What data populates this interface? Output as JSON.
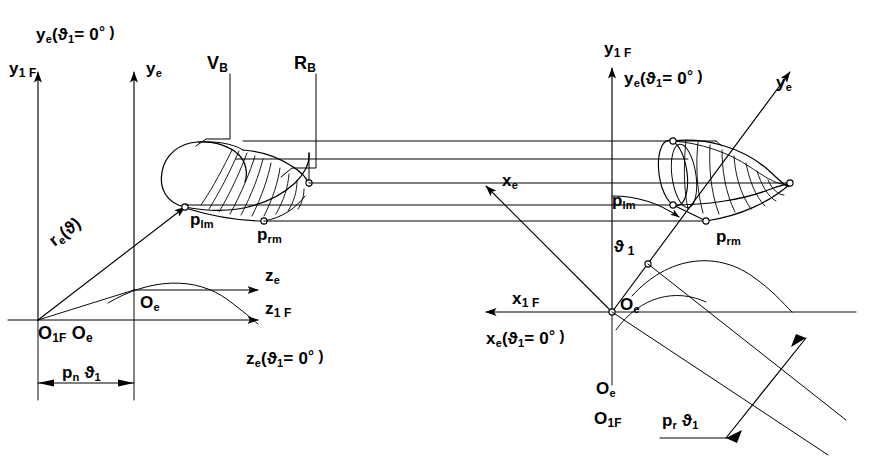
{
  "figure": {
    "domain": "technical-line-diagram",
    "width": 869,
    "height": 473,
    "background": "#ffffff",
    "ink": "#000000"
  },
  "labels": {
    "left_frame": {
      "y_e_zero": "y",
      "y_e_zero_sub": "e",
      "y_e_zero_paren": "(ϑ",
      "y_e_zero_paren_sub": "1",
      "y_e_zero_tail": "= 0",
      "y_e_zero_deg": "° )",
      "y_1F": "y",
      "y_1F_sub": "1 F",
      "y_e": "y",
      "y_e_sub": "e",
      "V_B": "V",
      "V_B_sub": "B",
      "R_B": "R",
      "R_B_sub": "B",
      "p_lm": "p",
      "p_lm_sub": "lm",
      "p_rm": "p",
      "p_rm_sub": "rm",
      "r_e": "r",
      "r_e_sub": "e",
      "r_e_arg": "(ϑ)",
      "O_e": "O",
      "O_e_sub": "e",
      "origin": "O",
      "origin_sub1": "1F",
      "origin_b": "O",
      "origin_b_sub": "e",
      "z_e": "z",
      "z_e_sub": "e",
      "z_1F": "z",
      "z_1F_sub": "1 F",
      "z_e_zero": "z",
      "z_e_zero_sub": "e",
      "z_e_zero_paren": "(ϑ",
      "z_e_zero_paren_sub": "1",
      "z_e_zero_tail": "= 0",
      "z_e_zero_deg": "° )",
      "p_n": "p",
      "p_n_sub": "n",
      "p_n_theta": "ϑ",
      "p_n_theta_sub": "1"
    },
    "right_frame": {
      "y_1F": "y",
      "y_1F_sub": "1 F",
      "y_e_zero": "y",
      "y_e_zero_sub": "e",
      "y_e_zero_paren": "(ϑ",
      "y_e_zero_paren_sub": "1",
      "y_e_zero_tail": "= 0",
      "y_e_zero_deg": "° )",
      "y_e": "y",
      "y_e_sub": "e",
      "x_e": "x",
      "x_e_sub": "e",
      "p_lm": "p",
      "p_lm_sub": "lm",
      "p_rm": "p",
      "p_rm_sub": "rm",
      "theta_1": "ϑ",
      "theta_1_sub": "1",
      "x_1F": "x",
      "x_1F_sub": "1 F",
      "x_e_zero": "x",
      "x_e_zero_sub": "e",
      "x_e_zero_paren": "(ϑ",
      "x_e_zero_paren_sub": "1",
      "x_e_zero_tail": "= 0",
      "x_e_zero_deg": "° )",
      "O_e_upper": "O",
      "O_e_upper_sub": "e",
      "O_e_lower": "O",
      "O_e_lower_sub": "e",
      "O_1F": "O",
      "O_1F_sub": "1F",
      "p_r": "p",
      "p_r_sub": "r",
      "p_r_theta": "ϑ",
      "p_r_theta_sub": "1"
    }
  }
}
